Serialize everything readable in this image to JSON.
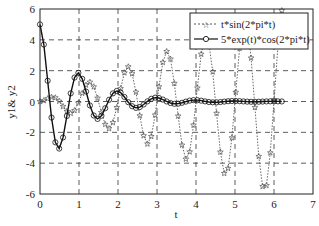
{
  "chart_data": {
    "type": "line",
    "title": "",
    "xlabel": "t",
    "ylabel": "y1& y2",
    "xlim": [
      0,
      7
    ],
    "ylim": [
      -6,
      6
    ],
    "xticks": [
      "0",
      "1",
      "2",
      "3",
      "4",
      "5",
      "6",
      "7"
    ],
    "yticks": [
      "-6",
      "-4",
      "-2",
      "0",
      "2",
      "4",
      "6"
    ],
    "grid": true,
    "grid_style": "dashed",
    "legend_position": "upper right",
    "series": [
      {
        "name": "t*sin(2*pi*t)",
        "line_style": "dotted",
        "marker": "star",
        "color": "#555555",
        "formula": "t*sin(2*pi*t)",
        "t_range": [
          0,
          6.2
        ],
        "points": 64
      },
      {
        "name": "5*exp(t)*cos(2*pi*t)",
        "line_style": "solid",
        "marker": "circle",
        "color": "#111111",
        "formula": "5*exp(-t)*cos(2*pi*t)",
        "t_range": [
          0,
          6.2
        ],
        "points": 64
      }
    ]
  },
  "axes": {
    "xlabel": "t",
    "ylabel": "y1& y2"
  },
  "legend": {
    "items": [
      {
        "label": "t*sin(2*pi*t)"
      },
      {
        "label": "5*exp(t)*cos(2*pi*t)"
      }
    ]
  }
}
